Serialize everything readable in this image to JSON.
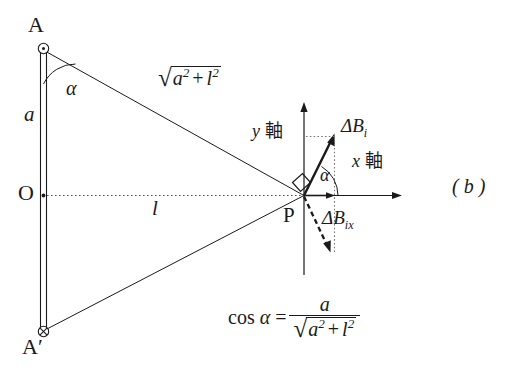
{
  "figure": {
    "panel_tag": "( b )",
    "colors": {
      "stroke": "#1a1a1a",
      "text": "#1a1a1a",
      "dotted": "#555555",
      "background": "#ffffff"
    }
  },
  "points": {
    "A": {
      "label": "A",
      "marker": "circle-dot-icon",
      "marker_meaning": "current out of page"
    },
    "A_prime": {
      "label": "A′",
      "marker": "circle-cross-icon",
      "marker_meaning": "current into page"
    },
    "O": {
      "label": "O",
      "marker": "dot-icon"
    },
    "P": {
      "label": "P",
      "marker": "field-point"
    }
  },
  "segments": {
    "wire_label": "a",
    "distance_label": "l",
    "hypotenuse": {
      "radical": "√",
      "radicand_a": "a",
      "radicand_exp_a": "2",
      "operator": "+",
      "radicand_l": "l",
      "radicand_exp_l": "2"
    }
  },
  "angles": {
    "at_A": "α",
    "at_P": "α",
    "right_angle_marker": "square-marker"
  },
  "axes": {
    "y": {
      "symbol": "y",
      "word": "軸",
      "full": "y 軸"
    },
    "x": {
      "symbol": "x",
      "word": "軸",
      "full": "x 軸"
    }
  },
  "vectors": {
    "delta_B_i": {
      "symbol": "ΔB",
      "subscript": "i",
      "style": "solid-arrow"
    },
    "delta_B_ix": {
      "symbol": "ΔB",
      "subscript": "ix",
      "style": "dashed-arrow"
    },
    "x_component": {
      "style": "solid-short-arrow"
    }
  },
  "formula": {
    "lhs_cos": "cos",
    "lhs_angle": "α",
    "equals": "=",
    "numerator": "a",
    "denominator": {
      "radical": "√",
      "term_a": "a",
      "exp_a": "2",
      "operator": "+",
      "term_l": "l",
      "exp_l": "2"
    }
  }
}
